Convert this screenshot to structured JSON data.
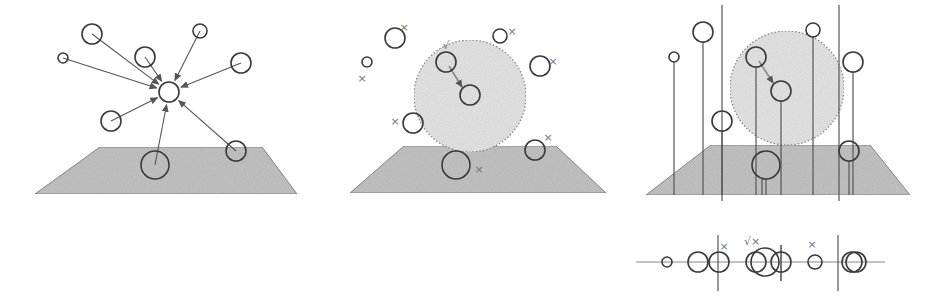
{
  "colors": {
    "stroke": "#3a3a3a",
    "arrow": "#555555",
    "plane_fill": "#c4c4c4",
    "plane_stroke": "#8a8a8a",
    "sphere_fill": "#e6e6e6",
    "sphere_stroke": "#8a8a8a",
    "mark": "#777777",
    "line": "#555555"
  },
  "panels": [
    {
      "id": "panel-1-attraction",
      "plane": [
        [
          100,
          147
        ],
        [
          262,
          147
        ],
        [
          297,
          194
        ],
        [
          35,
          194
        ]
      ],
      "target": {
        "x": 169,
        "y": 92,
        "r": 10
      },
      "nodes": [
        {
          "x": 92,
          "y": 34,
          "r": 10
        },
        {
          "x": 63,
          "y": 58,
          "r": 5
        },
        {
          "x": 145,
          "y": 57,
          "r": 10
        },
        {
          "x": 200,
          "y": 31,
          "r": 7
        },
        {
          "x": 241,
          "y": 63,
          "r": 10
        },
        {
          "x": 111,
          "y": 121,
          "r": 10
        },
        {
          "x": 155,
          "y": 165,
          "r": 14
        },
        {
          "x": 236,
          "y": 151,
          "r": 10
        }
      ]
    },
    {
      "id": "panel-2-neighborhood",
      "plane": [
        [
          404,
          146
        ],
        [
          556,
          146
        ],
        [
          606,
          193
        ],
        [
          350,
          193
        ]
      ],
      "sphere": {
        "cx": 470,
        "cy": 96,
        "r": 56
      },
      "nodes": [
        {
          "x": 395,
          "y": 38,
          "r": 10,
          "mark": "×",
          "mx": 404,
          "my": 28
        },
        {
          "x": 367,
          "y": 62,
          "r": 5,
          "mark": "×",
          "mx": 362,
          "my": 79
        },
        {
          "x": 446,
          "y": 62,
          "r": 10,
          "mark": "√",
          "mx": 446,
          "my": 46
        },
        {
          "x": 470,
          "y": 95,
          "r": 10,
          "mark": "",
          "mx": 0,
          "my": 0
        },
        {
          "x": 500,
          "y": 36,
          "r": 7,
          "mark": "×",
          "mx": 512,
          "my": 32
        },
        {
          "x": 540,
          "y": 66,
          "r": 10,
          "mark": "×",
          "mx": 553,
          "my": 62
        },
        {
          "x": 413,
          "y": 123,
          "r": 10,
          "mark": "×",
          "mx": 395,
          "my": 122
        },
        {
          "x": 456,
          "y": 165,
          "r": 14,
          "mark": "×",
          "mx": 479,
          "my": 170
        },
        {
          "x": 535,
          "y": 150,
          "r": 10,
          "mark": "×",
          "mx": 548,
          "my": 138
        }
      ]
    },
    {
      "id": "panel-3-projection",
      "plane": [
        [
          711,
          145
        ],
        [
          870,
          145
        ],
        [
          910,
          195
        ],
        [
          646,
          195
        ]
      ],
      "sphere": {
        "cx": 787,
        "cy": 88,
        "r": 57
      },
      "planes_vertical": [
        722,
        839
      ],
      "nodes": [
        {
          "x": 674,
          "y": 57,
          "r": 5
        },
        {
          "x": 703,
          "y": 32,
          "r": 10
        },
        {
          "x": 722,
          "y": 121,
          "r": 10
        },
        {
          "x": 756,
          "y": 57,
          "r": 10
        },
        {
          "x": 781,
          "y": 91,
          "r": 10
        },
        {
          "x": 813,
          "y": 30,
          "r": 7
        },
        {
          "x": 853,
          "y": 62,
          "r": 10
        },
        {
          "x": 766,
          "y": 165,
          "r": 14
        },
        {
          "x": 849,
          "y": 151,
          "r": 10
        }
      ]
    }
  ],
  "axis_strip": {
    "y": 262,
    "x_start": 636,
    "x_end": 885,
    "dividers": [
      718,
      838
    ],
    "divider_extent": [
      235,
      291
    ],
    "circles": [
      {
        "x": 667,
        "y": 262,
        "r": 5
      },
      {
        "x": 698,
        "y": 262,
        "r": 10
      },
      {
        "x": 719,
        "y": 262,
        "r": 10
      },
      {
        "x": 756,
        "y": 262,
        "r": 10
      },
      {
        "x": 765,
        "y": 262,
        "r": 14
      },
      {
        "x": 781,
        "y": 262,
        "r": 10
      },
      {
        "x": 815,
        "y": 262,
        "r": 7
      },
      {
        "x": 852,
        "y": 262,
        "r": 10
      },
      {
        "x": 856,
        "y": 262,
        "r": 10
      }
    ],
    "marks": [
      {
        "text": "×",
        "x": 724,
        "y": 247
      },
      {
        "text": "√×",
        "x": 752,
        "y": 242
      },
      {
        "text": "×",
        "x": 812,
        "y": 245
      }
    ],
    "extra_tick": {
      "x": 781,
      "y1": 245,
      "y2": 281
    }
  }
}
